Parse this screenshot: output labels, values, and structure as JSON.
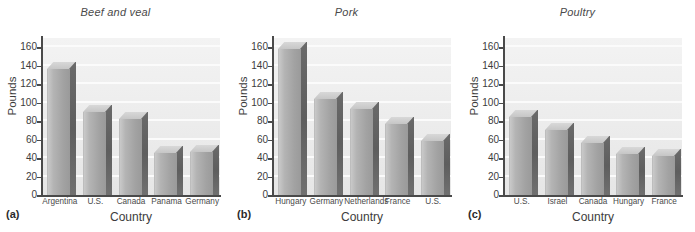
{
  "figure": {
    "panels": [
      {
        "letter": "(a)",
        "title": "Beef and veal",
        "ylabel": "Pounds",
        "xlabel": "Country"
      },
      {
        "letter": "(b)",
        "title": "Pork",
        "ylabel": "Pounds",
        "xlabel": "Country"
      },
      {
        "letter": "(c)",
        "title": "Poultry",
        "ylabel": "Pounds",
        "xlabel": "Country"
      }
    ],
    "yticks": [
      "0",
      "20",
      "40",
      "60",
      "80",
      "100",
      "120",
      "140",
      "160"
    ],
    "colors": {
      "bar_front_light": "#c9c9c9",
      "bar_front_dark": "#9a9a9a",
      "bar_side": "#5e5e5e",
      "bar_top": "#cfcfcf",
      "plot_background": "#eeeeee",
      "gridline": "#fbfbfb",
      "axis": "#4a4a4a",
      "text": "#3c3c3c"
    }
  },
  "chart_data": [
    {
      "type": "bar",
      "title": "Beef and veal",
      "panel": "(a)",
      "xlabel": "Country",
      "ylabel": "Pounds",
      "categories": [
        "Argentina",
        "U.S.",
        "Canada",
        "Panama",
        "Germany"
      ],
      "values": [
        136,
        90,
        82,
        46,
        47
      ],
      "ylim": [
        0,
        170
      ],
      "ytick_values": [
        0,
        20,
        40,
        60,
        80,
        100,
        120,
        140,
        160
      ],
      "grid": true,
      "legend": "none",
      "style": "3d-bar"
    },
    {
      "type": "bar",
      "title": "Pork",
      "panel": "(b)",
      "xlabel": "Country",
      "ylabel": "Pounds",
      "categories": [
        "Hungary",
        "Germany",
        "Netherlands",
        "France",
        "U.S."
      ],
      "values": [
        158,
        104,
        93,
        77,
        59
      ],
      "ylim": [
        0,
        170
      ],
      "ytick_values": [
        0,
        20,
        40,
        60,
        80,
        100,
        120,
        140,
        160
      ],
      "grid": true,
      "legend": "none",
      "style": "3d-bar"
    },
    {
      "type": "bar",
      "title": "Poultry",
      "panel": "(c)",
      "xlabel": "Country",
      "ylabel": "Pounds",
      "categories": [
        "U.S.",
        "Israel",
        "Canada",
        "Hungary",
        "France"
      ],
      "values": [
        85,
        70,
        56,
        44,
        42
      ],
      "ylim": [
        0,
        170
      ],
      "ytick_values": [
        0,
        20,
        40,
        60,
        80,
        100,
        120,
        140,
        160
      ],
      "grid": true,
      "legend": "none",
      "style": "3d-bar"
    }
  ]
}
